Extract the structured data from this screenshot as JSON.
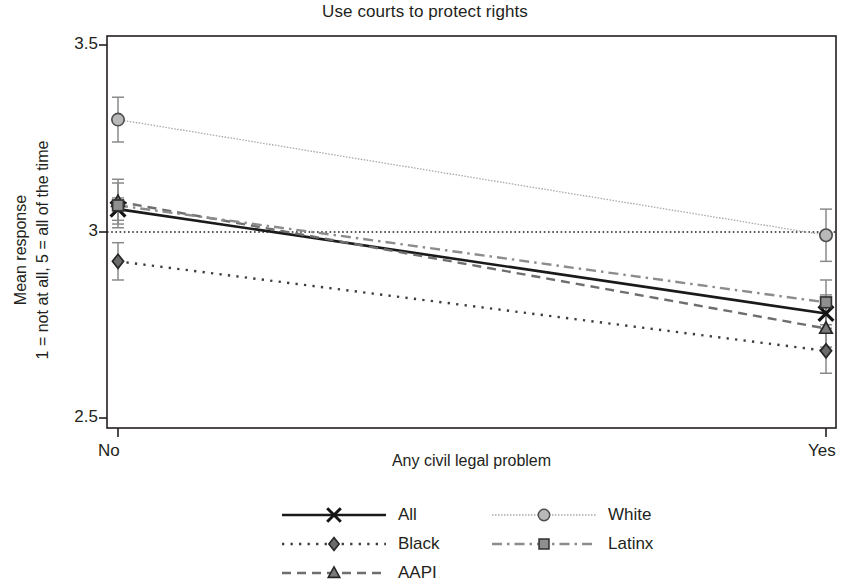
{
  "chart_data": {
    "type": "line",
    "title": "Use courts to protect rights",
    "xlabel": "Any civil legal problem",
    "ylabel": "Mean response\n1 = not at all, 5 = all of the time",
    "ylabel_line1": "Mean response",
    "ylabel_line2": "1 = not at all, 5 = all of the time",
    "categories": [
      "No",
      "Yes"
    ],
    "x": [
      0,
      1
    ],
    "ylim": [
      2.5,
      3.5
    ],
    "yticks": [
      3.5,
      3,
      2.5
    ],
    "ytick_labels": [
      "3.5",
      "3",
      "2.5"
    ],
    "xtick_labels": [
      "No",
      "Yes"
    ],
    "grid": false,
    "reference_line": {
      "y": 3.0,
      "style": "dotted",
      "color": "#231f20"
    },
    "legend_position": "bottom",
    "series": [
      {
        "name": "All",
        "values": [
          3.06,
          2.78
        ],
        "ci_low": [
          3.03,
          2.74
        ],
        "ci_high": [
          3.09,
          2.83
        ],
        "marker": "x",
        "line_style": "solid",
        "color": "#1a1a1a",
        "width": 2.6
      },
      {
        "name": "Black",
        "values": [
          2.92,
          2.68
        ],
        "ci_low": [
          2.87,
          2.62
        ],
        "ci_high": [
          2.97,
          2.74
        ],
        "marker": "diamond",
        "line_style": "dotted",
        "color": "#3d3d3d",
        "width": 2.4
      },
      {
        "name": "AAPI",
        "values": [
          3.08,
          2.74
        ],
        "ci_low": [
          3.02,
          2.69
        ],
        "ci_high": [
          3.14,
          2.8
        ],
        "marker": "triangle",
        "line_style": "dashed",
        "color": "#6e6e6e",
        "width": 2.4
      },
      {
        "name": "White",
        "values": [
          3.3,
          2.99
        ],
        "ci_low": [
          3.24,
          2.92
        ],
        "ci_high": [
          3.36,
          3.06
        ],
        "marker": "circle",
        "line_style": "thin-dotted",
        "color": "#a8a8a8",
        "width": 1.3
      },
      {
        "name": "Latinx",
        "values": [
          3.07,
          2.81
        ],
        "ci_low": [
          3.01,
          2.75
        ],
        "ci_high": [
          3.13,
          2.87
        ],
        "marker": "square",
        "line_style": "dash-dot",
        "color": "#8c8c8c",
        "width": 2.4
      }
    ]
  },
  "legend": {
    "rows": [
      [
        {
          "label": "All",
          "key": "all"
        },
        {
          "label": "White",
          "key": "white"
        }
      ],
      [
        {
          "label": "Black",
          "key": "black"
        },
        {
          "label": "Latinx",
          "key": "latinx"
        }
      ],
      [
        {
          "label": "AAPI",
          "key": "aapi"
        }
      ]
    ]
  },
  "colors": {
    "text": "#231f20",
    "axis": "#231f20",
    "all": "#1a1a1a",
    "black": "#3d3d3d",
    "aapi": "#6e6e6e",
    "white": "#a8a8a8",
    "latinx": "#8c8c8c"
  }
}
